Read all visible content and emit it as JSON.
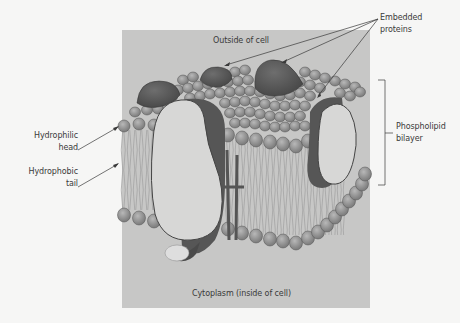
{
  "diagram": {
    "labels": {
      "outside": "Outside of cell",
      "inside": "Cytoplasm (inside of cell)",
      "embedded_line1": "Embedded",
      "embedded_line2": "proteins",
      "hydrophilic_line1": "Hydrophilic",
      "hydrophilic_line2": "head",
      "hydrophobic_line1": "Hydrophobic",
      "hydrophobic_line2": "tail",
      "bilayer_line1": "Phospholipid",
      "bilayer_line2": "bilayer"
    },
    "colors": {
      "background": "#f6f6f5",
      "panel": "#c7c7c6",
      "head": "#8a8a8a",
      "head_highlight": "#b5b5b5",
      "protein_dark": "#5a5a5a",
      "protein_light": "#d6d6d6",
      "tail": "#a9a9a9",
      "line": "#3a3a3a"
    }
  }
}
